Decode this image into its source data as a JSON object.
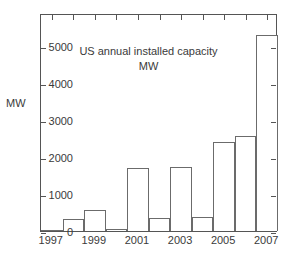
{
  "chart_data": {
    "type": "bar",
    "title": "US annual installed capacity",
    "subtitle": "MW",
    "xlabel": "",
    "ylabel": "MW",
    "categories": [
      1997,
      1998,
      1999,
      2000,
      2001,
      2002,
      2003,
      2004,
      2005,
      2006,
      2007
    ],
    "values": [
      10,
      320,
      560,
      60,
      1700,
      350,
      1720,
      390,
      2400,
      2580,
      5300
    ],
    "x_tick_labels": [
      "1997",
      "1999",
      "2001",
      "2003",
      "2005",
      "2007"
    ],
    "x_tick_values": [
      1997,
      1999,
      2001,
      2003,
      2005,
      2007
    ],
    "y_tick_labels": [
      "0",
      "1000",
      "2000",
      "3000",
      "4000",
      "5000"
    ],
    "y_tick_values": [
      0,
      1000,
      2000,
      3000,
      4000,
      5000
    ],
    "xlim": [
      1996.5,
      2007.5
    ],
    "ylim": [
      0,
      5900
    ],
    "grid": false,
    "legend": null,
    "bar_fill": "#ffffff",
    "bar_edge": "#6b6b6b",
    "axis_color": "#555555",
    "text_color": "#3a3a3a",
    "background": "#ffffff"
  }
}
